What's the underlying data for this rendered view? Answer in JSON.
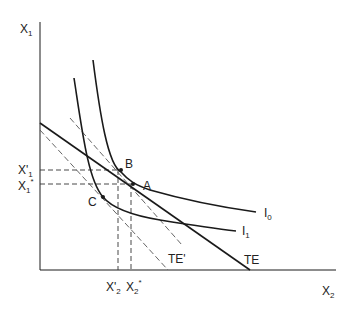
{
  "diagram": {
    "axes": {
      "y_label": "X",
      "y_label_sub": "1",
      "x_label": "X",
      "x_label_sub": "2"
    },
    "curves": {
      "I0": {
        "label": "I",
        "sub": "0"
      },
      "I1": {
        "label": "I",
        "sub": "1"
      },
      "TE": {
        "label": "TE"
      },
      "TE_prime": {
        "label": "TE'"
      }
    },
    "points": {
      "A": "A",
      "B": "B",
      "C": "C"
    },
    "tick_labels": {
      "x1_prime": {
        "main": "X'",
        "sub": "1"
      },
      "x1_star": {
        "main": "X",
        "sub": "1",
        "sup": "*"
      },
      "x2_prime": {
        "main": "X'",
        "sub": "2"
      },
      "x2_star": {
        "main": "X",
        "sub": "2",
        "sup": "*"
      }
    },
    "colors": {
      "line": "#1a1a1a",
      "dashed": "#555555"
    }
  }
}
